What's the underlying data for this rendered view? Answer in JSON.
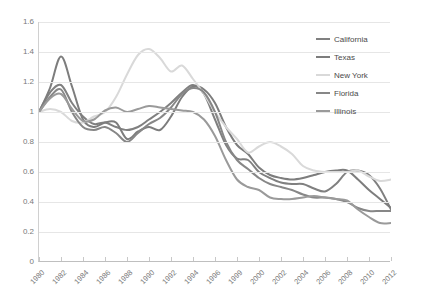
{
  "chart_data": {
    "type": "line",
    "title": "",
    "subtitle": "",
    "xlabel": "",
    "ylabel": "",
    "xlim": [
      1980,
      2012
    ],
    "ylim": [
      0,
      1.6
    ],
    "ytick_values": [
      0,
      0.2,
      0.4,
      0.6,
      0.8,
      1,
      1.2,
      1.4,
      1.6
    ],
    "ytick_labels": [
      "0",
      "0.2",
      "0.4",
      "0.6",
      "0.8",
      "1",
      "1.2",
      "1.4",
      "1.6"
    ],
    "xtick_labels": [
      "1980",
      "1982",
      "1984",
      "1986",
      "1988",
      "1990",
      "1992",
      "1994",
      "1996",
      "1999",
      "2000",
      "2002",
      "2004",
      "2006",
      "2008",
      "2010",
      "2012"
    ],
    "xtick_positions": [
      1980,
      1982,
      1984,
      1986,
      1988,
      1990,
      1992,
      1994,
      1996,
      1998,
      2000,
      2002,
      2004,
      2006,
      2008,
      2010,
      2012
    ],
    "grid": "horizontal",
    "legend_position": "right",
    "x": [
      1980,
      1981,
      1982,
      1983,
      1984,
      1985,
      1986,
      1987,
      1988,
      1989,
      1990,
      1991,
      1992,
      1993,
      1994,
      1995,
      1996,
      1997,
      1998,
      1999,
      2000,
      2001,
      2002,
      2003,
      2004,
      2005,
      2006,
      2007,
      2008,
      2009,
      2010,
      2011,
      2012
    ],
    "series": [
      {
        "name": "California",
        "color": "#808080",
        "values": [
          1.0,
          1.13,
          1.18,
          1.06,
          0.97,
          0.92,
          0.93,
          0.9,
          0.88,
          0.9,
          0.95,
          1.0,
          1.06,
          1.13,
          1.18,
          1.12,
          0.95,
          0.78,
          0.69,
          0.68,
          0.6,
          0.56,
          0.53,
          0.52,
          0.52,
          0.49,
          0.47,
          0.52,
          0.6,
          0.61,
          0.58,
          0.49,
          0.35
        ]
      },
      {
        "name": "Texas",
        "color": "#7d7d7d",
        "values": [
          1.0,
          1.16,
          1.37,
          1.17,
          0.95,
          0.9,
          0.93,
          0.93,
          0.82,
          0.87,
          0.9,
          0.88,
          0.97,
          1.1,
          1.17,
          1.15,
          1.06,
          0.9,
          0.78,
          0.72,
          0.63,
          0.58,
          0.56,
          0.55,
          0.56,
          0.58,
          0.6,
          0.61,
          0.61,
          0.55,
          0.48,
          0.42,
          0.36
        ]
      },
      {
        "name": "New York",
        "color": "#d9d9d9",
        "values": [
          1.0,
          1.02,
          1.0,
          0.94,
          0.93,
          0.97,
          1.0,
          1.1,
          1.25,
          1.38,
          1.42,
          1.36,
          1.27,
          1.31,
          1.22,
          1.12,
          1.0,
          0.9,
          0.82,
          0.73,
          0.77,
          0.8,
          0.77,
          0.72,
          0.64,
          0.61,
          0.6,
          0.6,
          0.6,
          0.61,
          0.57,
          0.54,
          0.55
        ]
      },
      {
        "name": "Florida",
        "color": "#878787",
        "values": [
          1.0,
          1.1,
          1.15,
          1.0,
          0.9,
          0.88,
          0.9,
          0.86,
          0.8,
          0.86,
          0.92,
          0.96,
          1.03,
          1.12,
          1.16,
          1.13,
          1.0,
          0.8,
          0.68,
          0.62,
          0.56,
          0.52,
          0.5,
          0.48,
          0.45,
          0.43,
          0.43,
          0.42,
          0.4,
          0.36,
          0.34,
          0.34,
          0.34
        ]
      },
      {
        "name": "Illinois",
        "color": "#9a9a9a",
        "values": [
          1.0,
          1.09,
          1.12,
          1.02,
          0.94,
          0.95,
          1.01,
          1.03,
          1.0,
          1.02,
          1.04,
          1.03,
          1.02,
          1.01,
          1.0,
          0.95,
          0.84,
          0.68,
          0.55,
          0.5,
          0.48,
          0.43,
          0.42,
          0.42,
          0.43,
          0.44,
          0.43,
          0.42,
          0.41,
          0.35,
          0.3,
          0.26,
          0.26
        ]
      }
    ]
  }
}
